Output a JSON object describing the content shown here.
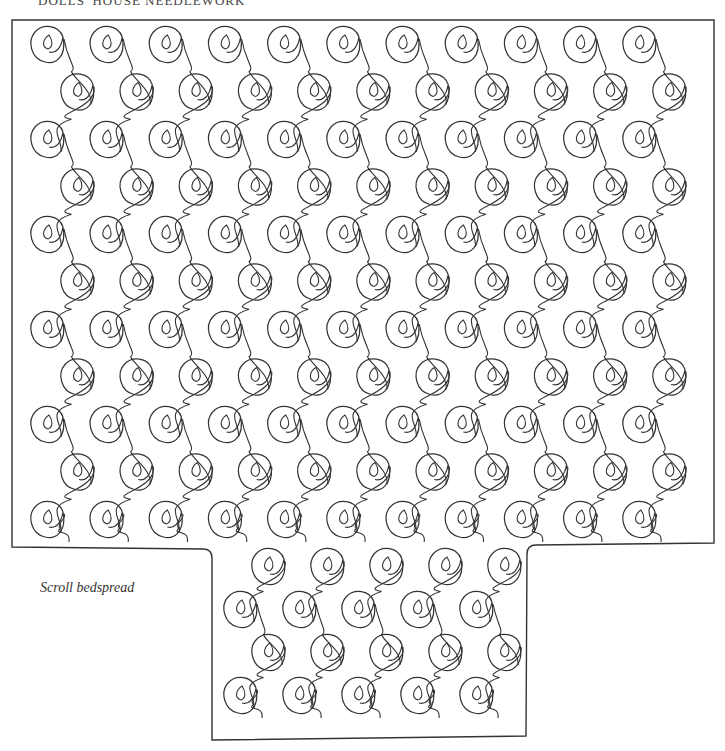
{
  "page": {
    "running_head": "DOLLS' HOUSE NEEDLEWORK",
    "caption": "Scroll bedspread"
  },
  "illustration": {
    "subject": "scroll-quilting-pattern",
    "motif": "spiral scroll with teardrop centre joined by wavy vine",
    "top_panel": {
      "columns": 11,
      "rows": 11
    },
    "bottom_panel": {
      "columns": 5,
      "rows": 4
    },
    "line_color": "#333333",
    "background_color": "#ffffff"
  }
}
